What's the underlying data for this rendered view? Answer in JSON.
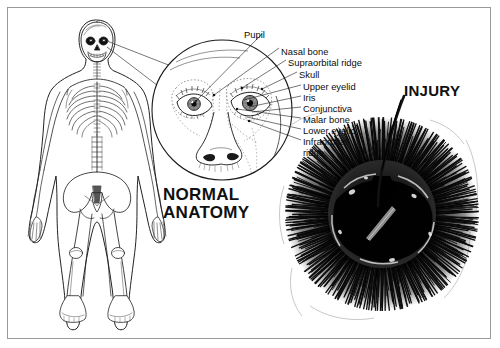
{
  "figure": {
    "background_color": "#ffffff",
    "border_color": "#9a9a9a",
    "ink_color": "#101010"
  },
  "captions": {
    "normal": "NORMAL\nANATOMY",
    "injury": "INJURY"
  },
  "panels": {
    "skeleton": {
      "name": "anterior full-body skeleton",
      "view": "anterior"
    },
    "magnifier": {
      "name": "magnified facial anatomy circle",
      "center_x": 222,
      "center_y": 110,
      "radius": 70
    },
    "injury": {
      "name": "periorbital hematoma mass",
      "center_x": 382,
      "center_y": 214,
      "radius": 96
    }
  },
  "labels": [
    {
      "text": "Pupil",
      "x": 244,
      "y": 30,
      "anchor_x": 196,
      "anchor_y": 101
    },
    {
      "text": "Nasal bone",
      "x": 281,
      "y": 47,
      "anchor_x": 214,
      "anchor_y": 95
    },
    {
      "text": "Supraorbital ridge",
      "x": 288,
      "y": 58,
      "anchor_x": 242,
      "anchor_y": 88
    },
    {
      "text": "Skull",
      "x": 299,
      "y": 70,
      "anchor_x": 262,
      "anchor_y": 89
    },
    {
      "text": "Upper eyelid",
      "x": 303,
      "y": 82,
      "anchor_x": 244,
      "anchor_y": 100
    },
    {
      "text": "Iris",
      "x": 303,
      "y": 93,
      "anchor_x": 249,
      "anchor_y": 107
    },
    {
      "text": "Conjunctiva",
      "x": 303,
      "y": 104,
      "anchor_x": 252,
      "anchor_y": 112
    },
    {
      "text": "Malar bone",
      "x": 303,
      "y": 115,
      "anchor_x": 237,
      "anchor_y": 109
    },
    {
      "text": "Lower eyelid",
      "x": 303,
      "y": 126,
      "anchor_x": 247,
      "anchor_y": 117
    },
    {
      "text": "Infraorbital",
      "x": 303,
      "y": 137,
      "anchor_x": 249,
      "anchor_y": 121
    },
    {
      "text": "ridge",
      "x": 303,
      "y": 148,
      "anchor_x": null,
      "anchor_y": null
    }
  ]
}
